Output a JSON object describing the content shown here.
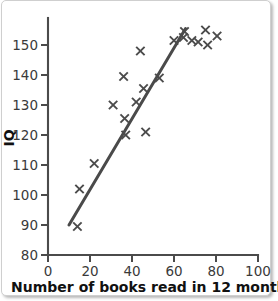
{
  "chart_data": {
    "type": "scatter",
    "title": "",
    "xlabel": "Number of books read in 12 months",
    "ylabel": "IQ",
    "xlim": [
      0,
      100
    ],
    "ylim": [
      80,
      157
    ],
    "xticks": [
      0,
      20,
      40,
      60,
      80,
      100
    ],
    "yticks": [
      80,
      90,
      100,
      110,
      120,
      130,
      140,
      150
    ],
    "xtick_labels": [
      "0",
      "20",
      "40",
      "60",
      "80",
      "100"
    ],
    "ytick_labels": [
      "80",
      "90",
      "100",
      "110",
      "120",
      "130",
      "140",
      "150"
    ],
    "grid": false,
    "legend": null,
    "marker": "x",
    "marker_color": "#4b4b4b",
    "series": [
      {
        "name": "Readers",
        "points": [
          {
            "x": 14.0,
            "y": 89.5
          },
          {
            "x": 15.0,
            "y": 102.0
          },
          {
            "x": 22.0,
            "y": 110.5
          },
          {
            "x": 31.0,
            "y": 130.0
          },
          {
            "x": 36.0,
            "y": 139.5
          },
          {
            "x": 36.5,
            "y": 125.5
          },
          {
            "x": 37.0,
            "y": 120.0
          },
          {
            "x": 42.0,
            "y": 131.0
          },
          {
            "x": 44.0,
            "y": 148.0
          },
          {
            "x": 45.5,
            "y": 135.5
          },
          {
            "x": 46.5,
            "y": 121.0
          },
          {
            "x": 53.0,
            "y": 139.0
          },
          {
            "x": 60.0,
            "y": 151.5
          },
          {
            "x": 64.5,
            "y": 152.5
          },
          {
            "x": 65.0,
            "y": 154.5
          },
          {
            "x": 68.5,
            "y": 151.5
          },
          {
            "x": 71.5,
            "y": 151.0
          },
          {
            "x": 75.0,
            "y": 155.0
          },
          {
            "x": 76.0,
            "y": 150.0
          },
          {
            "x": 80.5,
            "y": 153.0
          }
        ]
      }
    ],
    "trend_line": {
      "name": "line of best fit",
      "color": "#4a4a4a",
      "x0": 10.0,
      "y0": 90.0,
      "x1": 65.5,
      "y1": 155.5
    }
  }
}
